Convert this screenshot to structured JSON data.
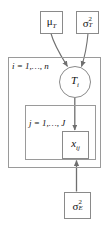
{
  "diagram": {
    "type": "plate-notation-graphical-model",
    "background_color": "#ffffff",
    "stroke_color": "#8a8a8a",
    "arrow_color": "#6f6f6f",
    "text_color": "#111111"
  },
  "nodes": {
    "mu_T": {
      "id": "mu_T",
      "shape": "square",
      "greek": "μ",
      "subscript": "T",
      "superscript": "",
      "label_plain": "μ_T"
    },
    "sigma2_T": {
      "id": "sigma2_T",
      "shape": "square",
      "greek": "σ",
      "subscript": "T",
      "superscript": "2",
      "label_plain": "σ²_T"
    },
    "T_i": {
      "id": "T_i",
      "shape": "circle",
      "base": "T",
      "subscript": "i",
      "superscript": "",
      "label_plain": "T_i"
    },
    "x_ij": {
      "id": "x_ij",
      "shape": "square",
      "base": "x",
      "subscript": "ij",
      "superscript": "",
      "label_plain": "x_ij"
    },
    "sigma2_E": {
      "id": "sigma2_E",
      "shape": "square",
      "greek": "σ",
      "subscript": "E",
      "superscript": "2",
      "label_plain": "σ²_E"
    }
  },
  "plates": {
    "outer": {
      "id": "plate-i",
      "index": "i",
      "range_text": "i = 1,…, n",
      "limit": "n"
    },
    "inner": {
      "id": "plate-j",
      "index": "j",
      "range_text": "j = 1,…, J",
      "limit": "J"
    }
  },
  "edges": [
    {
      "id": "edge-mu_T-to-T_i",
      "from": "mu_T",
      "to": "T_i",
      "style": "curved-arrow"
    },
    {
      "id": "edge-sigma2_T-to-T_i",
      "from": "sigma2_T",
      "to": "T_i",
      "style": "curved-arrow"
    },
    {
      "id": "edge-T_i-to-x_ij",
      "from": "T_i",
      "to": "x_ij",
      "style": "straight-arrow"
    },
    {
      "id": "edge-sigma2_E-to-x_ij",
      "from": "sigma2_E",
      "to": "x_ij",
      "style": "straight-arrow"
    }
  ]
}
